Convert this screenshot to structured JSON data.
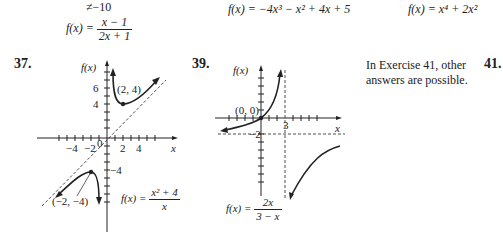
{
  "top": {
    "partial_label": "−10",
    "eq35": {
      "lhs": "f(x) =",
      "num": "x − 1",
      "den": "2x + 1"
    },
    "eq_mid": "f(x) = −4x³ − x² + 4x + 5",
    "eq_right": "f(x) = x⁴ + 2x²"
  },
  "ex37": {
    "number": "37.",
    "y_axis_label": "f(x)",
    "x_axis_label": "x",
    "point_label": "(2, 4)",
    "point_label2": "(−2, −4)",
    "y_ticks": [
      "6",
      "4",
      "−4"
    ],
    "x_ticks": [
      "−4",
      "−2",
      "0",
      "2",
      "4"
    ],
    "func_lhs": "f(x) =",
    "func_num": "x² + 4",
    "func_den": "x"
  },
  "ex39": {
    "number": "39.",
    "y_axis_label": "f(x)",
    "x_axis_label": "x",
    "point_label": "(0, 0)",
    "tick_3": "3",
    "tick_neg2": "−2",
    "func_lhs": "f(x) =",
    "func_num": "2x",
    "func_den": "3 − x"
  },
  "note": {
    "line1": "In Exercise 41, other",
    "line2": "answers are possible."
  },
  "ex41": {
    "number": "41."
  }
}
